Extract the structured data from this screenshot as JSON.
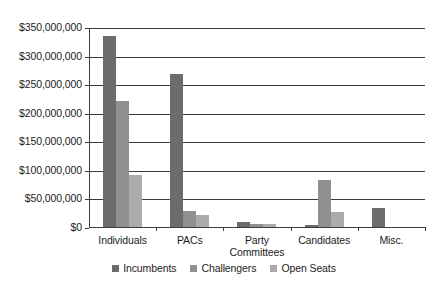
{
  "chart_data": {
    "type": "bar",
    "title": "",
    "xlabel": "",
    "ylabel": "",
    "ylim": [
      0,
      350000000
    ],
    "grid": true,
    "legend_position": "bottom",
    "categories": [
      "Individuals",
      "PACs",
      "Party\nCommittees",
      "Candidates",
      "Misc."
    ],
    "ytick_labels": [
      "$350,000,000",
      "$300,000,000",
      "$250,000,000",
      "$200,000,000",
      "$150,000,000",
      "$100,000,000",
      "$50,000,000",
      "$0"
    ],
    "ytick_values": [
      350000000,
      300000000,
      250000000,
      200000000,
      150000000,
      100000000,
      50000000,
      0
    ],
    "series": [
      {
        "name": "Incumbents",
        "color": "#6c6c6c",
        "values": [
          335000000,
          268000000,
          8000000,
          4000000,
          33000000
        ]
      },
      {
        "name": "Challengers",
        "color": "#909090",
        "values": [
          220000000,
          28000000,
          6000000,
          82000000,
          0
        ]
      },
      {
        "name": "Open Seats",
        "color": "#ababab",
        "values": [
          91000000,
          21000000,
          5000000,
          26000000,
          0
        ]
      }
    ]
  },
  "legend": {
    "items": [
      {
        "label": "Incumbents",
        "key": "incumbents"
      },
      {
        "label": "Challengers",
        "key": "challengers"
      },
      {
        "label": "Open Seats",
        "key": "openseats"
      }
    ]
  }
}
